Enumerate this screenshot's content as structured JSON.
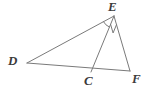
{
  "figure": {
    "kind": "geometry-diagram",
    "background_color": "#ffffff",
    "stroke_color": "#7a7a7a",
    "label_color": "#3b3b3b",
    "stroke_width": 1,
    "width": 151,
    "height": 90,
    "vertices": [
      {
        "id": "D",
        "label": "D",
        "x": 27,
        "y": 63
      },
      {
        "id": "E",
        "label": "E",
        "x": 114,
        "y": 16
      },
      {
        "id": "C",
        "label": "C",
        "x": 91,
        "y": 72
      },
      {
        "id": "F",
        "label": "F",
        "x": 130,
        "y": 71
      }
    ],
    "segments": [
      {
        "id": "DE",
        "from": "D",
        "to": "E"
      },
      {
        "id": "DF",
        "from": "D",
        "to": "F"
      },
      {
        "id": "EF",
        "from": "E",
        "to": "F"
      },
      {
        "id": "EC",
        "from": "E",
        "to": "C"
      }
    ],
    "angle_marks": [
      {
        "id": "angle-DEC",
        "at": "E",
        "between": [
          "D",
          "C"
        ],
        "style": "arc"
      },
      {
        "id": "angle-CEF",
        "at": "E",
        "between": [
          "C",
          "F"
        ],
        "style": "square"
      }
    ]
  }
}
